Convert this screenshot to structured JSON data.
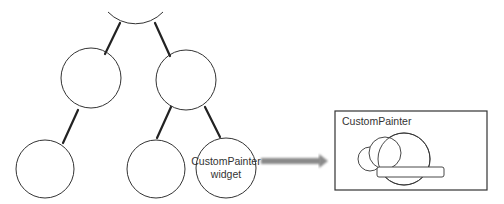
{
  "diagram": {
    "type": "widget-tree",
    "colors": {
      "stroke": "#333333",
      "edge": "#222222",
      "arrow": "#888888",
      "text": "#333333",
      "background": "#ffffff"
    },
    "nodes": [
      {
        "id": "root",
        "label": "",
        "partial": true
      },
      {
        "id": "mid-left",
        "label": ""
      },
      {
        "id": "mid-right",
        "label": ""
      },
      {
        "id": "bottom-left",
        "label": ""
      },
      {
        "id": "bottom-middle",
        "label": ""
      },
      {
        "id": "bottom-right",
        "label_line1": "CustomPainter",
        "label_line2": "widget"
      }
    ],
    "edges": [
      {
        "from": "root",
        "to": "mid-left"
      },
      {
        "from": "root",
        "to": "mid-right"
      },
      {
        "from": "mid-left",
        "to": "bottom-left"
      },
      {
        "from": "mid-right",
        "to": "bottom-middle"
      },
      {
        "from": "mid-right",
        "to": "bottom-right"
      }
    ],
    "canvas_box": {
      "title": "CustomPainter",
      "content": "cloud-drawing"
    }
  }
}
